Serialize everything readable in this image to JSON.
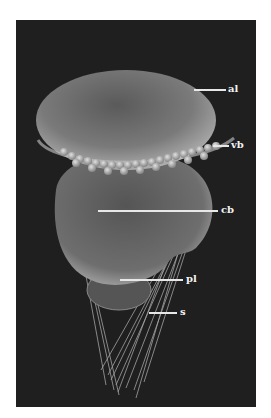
{
  "figure": {
    "background_color": "#1f1f1f",
    "labels": [
      {
        "id": "al",
        "text": "al"
      },
      {
        "id": "vb",
        "text": "vb"
      },
      {
        "id": "cb",
        "text": "cb"
      },
      {
        "id": "pl",
        "text": "pl"
      },
      {
        "id": "s",
        "text": "s"
      }
    ]
  }
}
